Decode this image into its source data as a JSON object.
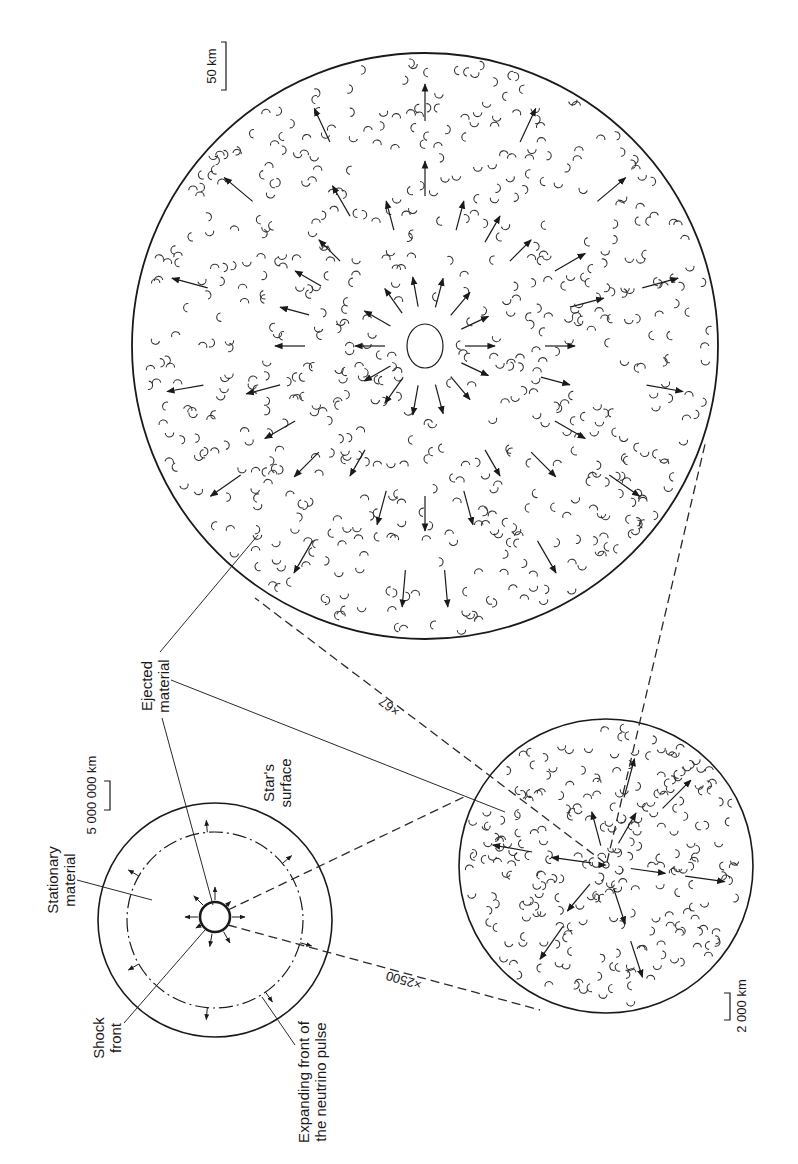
{
  "figure": {
    "colors": {
      "ink": "#1a1a1a",
      "stipple_fill": "#d9d9d9",
      "background": "#ffffff"
    }
  },
  "panels": {
    "star": {
      "labels": {
        "stationary_material_line1": "Stationary",
        "stationary_material_line2": "material",
        "shock_front_line1": "Shock",
        "shock_front_line2": "front",
        "neutrino_line1": "Expanding front of",
        "neutrino_line2": "the neutrino pulse",
        "surface_line1": "Star's",
        "surface_line2": "surface",
        "ejected_line1": "Ejected",
        "ejected_line2": "material"
      },
      "scale_bar": "5 000 000 km"
    },
    "middle": {
      "scale_bar": "2 000 km",
      "magnification": "×2500"
    },
    "large": {
      "scale_bar": "50 km",
      "magnification": "×67"
    }
  }
}
